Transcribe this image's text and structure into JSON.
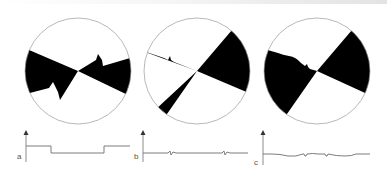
{
  "figure": {
    "colors": {
      "wedge": "#000000",
      "circle_outline": "#9a9a9a",
      "trace": "#6e6e6e",
      "axis": "#6e6e6e",
      "background": "#ffffff"
    },
    "panels": [
      {
        "label": "a",
        "disk": {
          "description": "Two opposing black wedges with jagged (sawtooth) boundary on one side",
          "center": [
            78,
            71
          ],
          "radius": 53
        },
        "trace": {
          "description": "Square-wave: high level, steps down, stays low, steps back up",
          "shape": "square-wave"
        }
      },
      {
        "label": "b",
        "disk": {
          "description": "Two opposing black wedges, one boundary with a small notch",
          "center": [
            197,
            71
          ],
          "radius": 53
        },
        "trace": {
          "description": "Flat line with two small zig-zag transients",
          "shape": "flat-with-glitches"
        }
      },
      {
        "label": "c",
        "disk": {
          "description": "Two opposing black wedges, one boundary with a smoothly undulating edge",
          "center": [
            317,
            71
          ],
          "radius": 53
        },
        "trace": {
          "description": "Gently wavy line with two small notches",
          "shape": "wavy-with-notches"
        }
      }
    ]
  }
}
